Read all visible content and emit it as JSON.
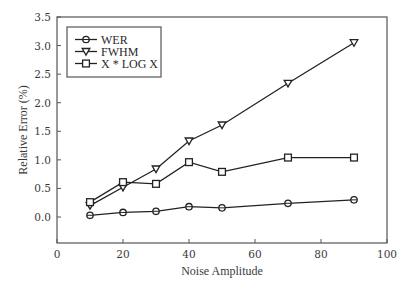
{
  "chart_data": {
    "type": "line",
    "title": "",
    "xlabel": "Noise Amplitude",
    "ylabel": "Relative Error (%)",
    "xlim": [
      0,
      100
    ],
    "ylim": [
      -0.45,
      3.5
    ],
    "grid": false,
    "legend_position": "upper left",
    "x_ticks": [
      0,
      20,
      40,
      60,
      80,
      100
    ],
    "x_tick_labels": [
      "0",
      "20",
      "40",
      "60",
      "80",
      "100"
    ],
    "y_ticks": [
      0.0,
      0.5,
      1.0,
      1.5,
      2.0,
      2.5,
      3.0,
      3.5
    ],
    "y_tick_labels": [
      "0.0",
      "0.5",
      "1.0",
      "1.5",
      "2.0",
      "2.5",
      "3.0",
      "3.5"
    ],
    "x": [
      10,
      20,
      30,
      40,
      50,
      70,
      90
    ],
    "series": [
      {
        "name": "WER",
        "marker": "circle",
        "values": [
          0.03,
          0.08,
          0.1,
          0.18,
          0.16,
          0.24,
          0.3
        ]
      },
      {
        "name": "FWHM",
        "marker": "triangle-down",
        "values": [
          0.2,
          0.52,
          0.84,
          1.33,
          1.61,
          2.34,
          3.05
        ]
      },
      {
        "name": "X * LOG X",
        "marker": "square",
        "values": [
          0.26,
          0.61,
          0.58,
          0.96,
          0.79,
          1.04,
          1.04
        ]
      }
    ]
  },
  "colors": {
    "line": "#222222",
    "frame": "#555555",
    "text": "#3a3a3a",
    "background": "#ffffff"
  }
}
